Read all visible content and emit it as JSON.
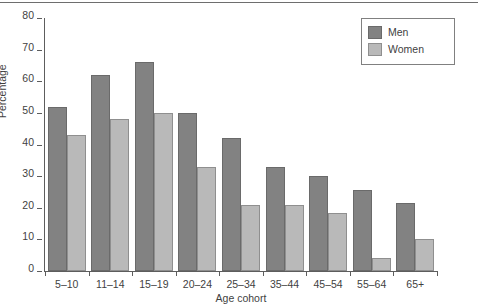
{
  "chart_data": {
    "type": "bar",
    "title": "",
    "subtitle": "",
    "xlabel": "Age cohort",
    "ylabel": "Percentage",
    "categories": [
      "5–10",
      "11–14",
      "15–19",
      "20–24",
      "25–34",
      "35–44",
      "45–54",
      "55–64",
      "65+"
    ],
    "series": [
      {
        "name": "Men",
        "color": "#828282",
        "values": [
          52,
          62,
          66,
          50,
          42,
          33,
          30,
          25.5,
          21.5
        ]
      },
      {
        "name": "Women",
        "color": "#b9b9b9",
        "values": [
          43,
          48,
          50,
          33,
          21,
          21,
          18.5,
          4,
          10
        ]
      }
    ],
    "ylim": [
      0,
      80
    ],
    "yticks": [
      0,
      10,
      20,
      30,
      40,
      50,
      60,
      70,
      80
    ],
    "ytick_labels": [
      "0",
      "10",
      "20",
      "30",
      "40",
      "50",
      "60",
      "70",
      "80"
    ],
    "grid": false,
    "legend_position": "top-right",
    "legend_entries": [
      "Men",
      "Women"
    ]
  }
}
